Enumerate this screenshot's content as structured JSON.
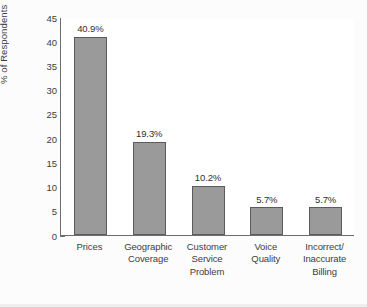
{
  "chart_data": {
    "type": "bar",
    "title": "",
    "xlabel": "",
    "ylabel": "% of Respondents",
    "ylim": [
      0,
      45
    ],
    "yticks": [
      0,
      5,
      10,
      15,
      20,
      25,
      30,
      35,
      40,
      45
    ],
    "grid": false,
    "legend": null,
    "categories": [
      "Prices",
      "Geographic Coverage",
      "Customer Service Problem",
      "Voice Quality",
      "Incorrect/ Inaccurate Billing"
    ],
    "category_lines": [
      [
        "Prices"
      ],
      [
        "Geographic",
        "Coverage"
      ],
      [
        "Customer",
        "Service",
        "Problem"
      ],
      [
        "Voice",
        "Quality"
      ],
      [
        "Incorrect/",
        "Inaccurate",
        "Billing"
      ]
    ],
    "values": [
      40.9,
      19.3,
      10.2,
      5.7,
      5.7
    ],
    "data_labels": [
      "40.9%",
      "19.3%",
      "10.2%",
      "5.7%",
      "5.7%"
    ],
    "bar_color": "#9a9a9a",
    "bar_edge_color": "#5b5b5b",
    "annotations": [
      {
        "lines": [
          "The remaining 20% is due to",
          "involuntary churn (e.g., death)"
        ],
        "position": "top-right"
      }
    ]
  }
}
